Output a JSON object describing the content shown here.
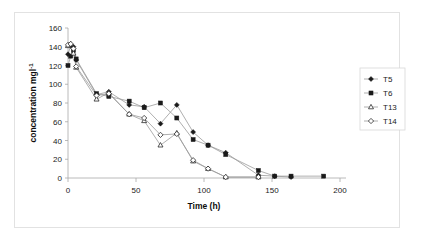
{
  "figure": {
    "background_color": "#ffffff",
    "frame_color": "#e2e2e2",
    "line_color": "#9a9a9a",
    "axis_color": "#a8a8a8",
    "marker_color": "#1a1a1a"
  },
  "chart_data": {
    "type": "scatter",
    "title": "",
    "xlabel": "Time (h)",
    "ylabel": "concentration mgl-1",
    "ylabel_display": "concentration mgl",
    "ylabel_exponent": "-1",
    "xlim": [
      0,
      200
    ],
    "ylim": [
      0,
      160
    ],
    "xticks": [
      0,
      50,
      100,
      150,
      200
    ],
    "yticks": [
      0,
      20,
      40,
      60,
      80,
      100,
      120,
      140,
      160
    ],
    "xtick_labels": [
      "0",
      "50",
      "100",
      "150",
      "200"
    ],
    "ytick_labels": [
      "0",
      "20",
      "40",
      "60",
      "80",
      "100",
      "120",
      "140",
      "160"
    ],
    "grid": false,
    "legend_position": "right",
    "series": [
      {
        "name": "T5",
        "marker": "filled-diamond",
        "x": [
          0,
          2,
          4,
          6,
          21,
          30,
          45,
          56,
          68,
          80,
          92,
          103,
          116,
          140,
          152,
          164
        ],
        "y": [
          132,
          141,
          140,
          126,
          89,
          92,
          78,
          76,
          58,
          78,
          49,
          35,
          27,
          3,
          2,
          1
        ]
      },
      {
        "name": "T6",
        "marker": "filled-square",
        "x": [
          0,
          2,
          4,
          6,
          21,
          30,
          45,
          56,
          68,
          80,
          92,
          103,
          116,
          140,
          152,
          164,
          188
        ],
        "y": [
          120,
          130,
          136,
          127,
          90,
          87,
          82,
          75,
          80,
          64,
          41,
          35,
          25,
          8,
          2,
          2,
          2
        ]
      },
      {
        "name": "T13",
        "marker": "open-triangle",
        "x": [
          0,
          2,
          4,
          6,
          21,
          30,
          45,
          56,
          68,
          80,
          92,
          103,
          116,
          140
        ],
        "y": [
          141,
          143,
          133,
          118,
          84,
          91,
          68,
          61,
          35,
          48,
          18,
          10,
          1,
          1
        ]
      },
      {
        "name": "T14",
        "marker": "open-diamond",
        "x": [
          0,
          2,
          4,
          6,
          21,
          30,
          45,
          56,
          68,
          80,
          92,
          103,
          116,
          140
        ],
        "y": [
          142,
          143,
          138,
          119,
          88,
          90,
          68,
          64,
          46,
          47,
          19,
          10,
          1,
          1
        ]
      }
    ]
  },
  "legend": {
    "items": [
      {
        "label": "T5"
      },
      {
        "label": "T6"
      },
      {
        "label": "T13"
      },
      {
        "label": "T14"
      }
    ]
  }
}
